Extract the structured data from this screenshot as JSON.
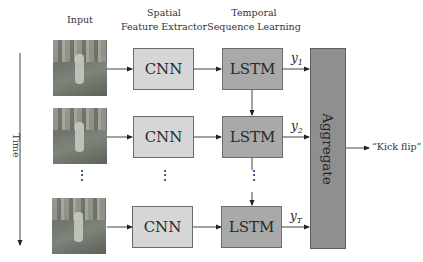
{
  "diagram": {
    "headers": {
      "input": "Input",
      "spatial_line1": "Spatial",
      "spatial_line2": "Feature Extractor",
      "temporal_line1": "Temporal",
      "temporal_line2": "Sequence Learning"
    },
    "time_label": "Time",
    "rows": [
      {
        "cnn": "CNN",
        "lstm": "LSTM",
        "output_var": "y",
        "output_sub": "1"
      },
      {
        "cnn": "CNN",
        "lstm": "LSTM",
        "output_var": "y",
        "output_sub": "2"
      },
      {
        "cnn": "CNN",
        "lstm": "LSTM",
        "output_var": "y",
        "output_sub": "T"
      }
    ],
    "ellipsis": "⋮",
    "aggregate_label": "Aggregate",
    "output_label": "“Kick flip”",
    "colors": {
      "cnn_fill": "#d6d6d6",
      "lstm_fill": "#a9a9a9",
      "aggregate_fill": "#8f8f8f",
      "stroke": "#333333"
    }
  }
}
